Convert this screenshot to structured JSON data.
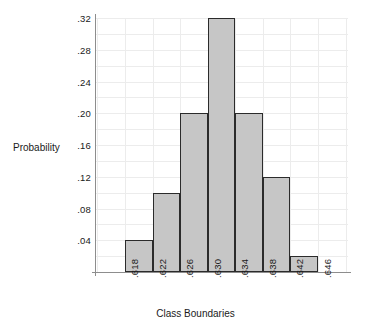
{
  "chart_data": {
    "type": "bar",
    "title": "",
    "subtitle": "",
    "xlabel": "Class Boundaries",
    "ylabel": "Probability",
    "grid": true,
    "legend": false,
    "legend_position": "none",
    "bar_fill_color": "#c6c6c6",
    "bar_edge_color": "#2b2b2b",
    "grid_color": "#ececec",
    "axis_color": "#8d8d8d",
    "background_color": "#ffffff",
    "xlim": [
      0.618,
      0.646
    ],
    "ylim": [
      0,
      0.32
    ],
    "x_boundaries": [
      ".618",
      ".622",
      ".626",
      ".630",
      ".634",
      ".638",
      ".642",
      ".646"
    ],
    "x_boundaries_numeric": [
      0.618,
      0.622,
      0.626,
      0.63,
      0.634,
      0.638,
      0.642,
      0.646
    ],
    "y_ticks": [
      ".04",
      ".08",
      ".12",
      ".16",
      ".20",
      ".24",
      ".28",
      ".32"
    ],
    "y_ticks_numeric": [
      0.04,
      0.08,
      0.12,
      0.16,
      0.2,
      0.24,
      0.28,
      0.32
    ],
    "categories": [
      ".618-.622",
      ".622-.626",
      ".626-.630",
      ".630-.634",
      ".634-.638",
      ".638-.642",
      ".642-.646"
    ],
    "values": [
      0.04,
      0.1,
      0.2,
      0.32,
      0.2,
      0.12,
      0.02
    ],
    "bars": [
      {
        "label": ".618-.622",
        "lower": 0.618,
        "upper": 0.622,
        "value": 0.04
      },
      {
        "label": ".622-.626",
        "lower": 0.622,
        "upper": 0.626,
        "value": 0.1
      },
      {
        "label": ".626-.630",
        "lower": 0.626,
        "upper": 0.63,
        "value": 0.2
      },
      {
        "label": ".630-.634",
        "lower": 0.63,
        "upper": 0.634,
        "value": 0.32
      },
      {
        "label": ".634-.638",
        "lower": 0.634,
        "upper": 0.638,
        "value": 0.2
      },
      {
        "label": ".638-.642",
        "lower": 0.638,
        "upper": 0.642,
        "value": 0.12
      },
      {
        "label": ".642-.646",
        "lower": 0.642,
        "upper": 0.646,
        "value": 0.02
      }
    ]
  }
}
